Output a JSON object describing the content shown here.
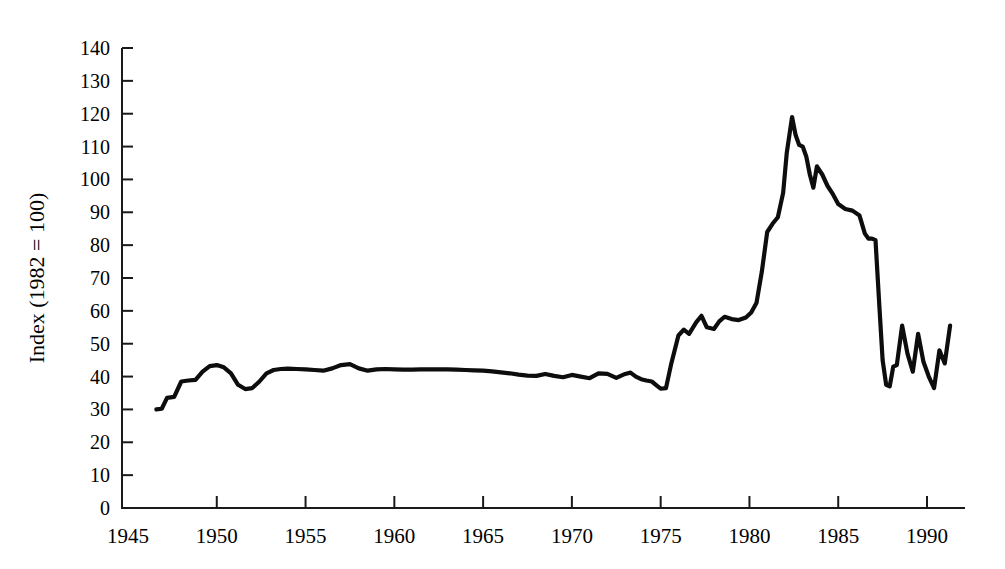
{
  "chart_data": {
    "type": "line",
    "title": "",
    "xlabel": "",
    "ylabel": "Index (1982 = 100)",
    "xlim": [
      1945,
      1991.5
    ],
    "ylim": [
      0,
      140
    ],
    "grid": false,
    "legend": null,
    "y_ticks": [
      0,
      10,
      20,
      30,
      40,
      50,
      60,
      70,
      80,
      90,
      100,
      110,
      120,
      130,
      140
    ],
    "y_tick_labels": [
      "0",
      "10",
      "20",
      "30",
      "40",
      "50",
      "60",
      "70",
      "80",
      "90",
      "100",
      "110",
      "120",
      "130",
      "140"
    ],
    "x_ticks": [
      1945,
      1950,
      1955,
      1960,
      1965,
      1970,
      1975,
      1980,
      1985,
      1990
    ],
    "x_tick_labels": [
      "1945",
      "1950",
      "1955",
      "1960",
      "1965",
      "1970",
      "1975",
      "1980",
      "1985",
      "1990"
    ],
    "series": [
      {
        "name": "Index (1982 = 100)",
        "color": "#0d0d0d",
        "x": [
          1946.6,
          1946.9,
          1947.2,
          1947.6,
          1948.0,
          1948.4,
          1948.8,
          1949.2,
          1949.6,
          1950.0,
          1950.4,
          1950.8,
          1951.2,
          1951.6,
          1952.0,
          1952.4,
          1952.8,
          1953.2,
          1953.6,
          1954.0,
          1954.5,
          1955.0,
          1955.5,
          1956.0,
          1956.5,
          1957.0,
          1957.5,
          1958.0,
          1958.5,
          1959.0,
          1959.5,
          1960.0,
          1960.5,
          1961.0,
          1961.5,
          1962.0,
          1962.5,
          1963.0,
          1963.5,
          1964.0,
          1964.5,
          1965.0,
          1965.5,
          1966.0,
          1966.5,
          1967.0,
          1967.5,
          1968.0,
          1968.5,
          1969.0,
          1969.5,
          1970.0,
          1970.5,
          1971.0,
          1971.5,
          1972.0,
          1972.5,
          1973.0,
          1973.3,
          1973.6,
          1973.9,
          1974.2,
          1974.5,
          1974.8,
          1975.0,
          1975.3,
          1975.6,
          1976.0,
          1976.3,
          1976.6,
          1977.0,
          1977.3,
          1977.6,
          1978.0,
          1978.3,
          1978.6,
          1979.0,
          1979.4,
          1979.8,
          1980.1,
          1980.4,
          1980.7,
          1981.0,
          1981.3,
          1981.6,
          1981.9,
          1982.1,
          1982.4,
          1982.6,
          1982.8,
          1983.0,
          1983.2,
          1983.4,
          1983.6,
          1983.8,
          1984.1,
          1984.4,
          1984.7,
          1985.0,
          1985.4,
          1985.8,
          1986.2,
          1986.5,
          1986.7,
          1986.9,
          1987.1,
          1987.3,
          1987.5,
          1987.7,
          1987.9,
          1988.1,
          1988.3,
          1988.6,
          1988.9,
          1989.2,
          1989.5,
          1989.8,
          1990.1,
          1990.4,
          1990.7,
          1991.0,
          1991.3
        ],
        "y": [
          30.0,
          30.2,
          33.5,
          33.8,
          38.5,
          38.8,
          39.0,
          41.5,
          43.2,
          43.5,
          42.8,
          41.0,
          37.5,
          36.2,
          36.5,
          38.5,
          41.0,
          42.0,
          42.3,
          42.4,
          42.3,
          42.2,
          42.0,
          41.8,
          42.5,
          43.5,
          43.8,
          42.5,
          41.8,
          42.2,
          42.3,
          42.2,
          42.1,
          42.1,
          42.2,
          42.2,
          42.2,
          42.2,
          42.1,
          42.0,
          41.9,
          41.8,
          41.6,
          41.3,
          41.0,
          40.6,
          40.3,
          40.2,
          40.8,
          40.2,
          39.8,
          40.5,
          40.0,
          39.5,
          41.0,
          40.8,
          39.6,
          40.8,
          41.2,
          40.0,
          39.2,
          38.8,
          38.5,
          37.2,
          36.3,
          36.5,
          44.0,
          52.5,
          54.3,
          53.0,
          56.5,
          58.5,
          55.0,
          54.5,
          56.8,
          58.2,
          57.5,
          57.2,
          58.0,
          59.5,
          62.5,
          72.0,
          84.0,
          86.5,
          88.5,
          96.0,
          108.0,
          119.0,
          113.5,
          110.5,
          110.0,
          107.0,
          101.5,
          97.5,
          104.0,
          101.5,
          98.0,
          95.5,
          92.5,
          91.0,
          90.5,
          89.0,
          83.5,
          82.0,
          82.0,
          81.5,
          63.0,
          45.0,
          37.5,
          37.0,
          43.0,
          43.5,
          55.5,
          47.0,
          41.5,
          53.0,
          44.5,
          40.0,
          36.5,
          48.0,
          44.0,
          55.5
        ]
      }
    ]
  },
  "axes": {
    "y_axis_title": "Index (1982 = 100)"
  }
}
